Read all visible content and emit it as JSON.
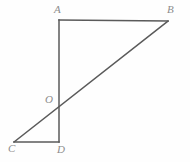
{
  "figure": {
    "name": "quadrilateral-with-diagonal",
    "background_color": "#fefefe",
    "stroke_color": "#5a5a5a",
    "label_color": "#8d8d8d",
    "stroke_width": 1.5,
    "width": 190,
    "height": 162,
    "points": {
      "A": {
        "label": "A",
        "x": 59,
        "y": 20
      },
      "B": {
        "label": "B",
        "x": 168,
        "y": 21
      },
      "C": {
        "label": "C",
        "x": 14,
        "y": 142
      },
      "D": {
        "label": "D",
        "x": 59,
        "y": 142
      },
      "O": {
        "label": "O",
        "x": 59,
        "y": 102
      }
    },
    "segments": [
      {
        "name": "segment-ab",
        "from": "A",
        "to": "B"
      },
      {
        "name": "segment-ad",
        "from": "A",
        "to": "D"
      },
      {
        "name": "segment-cd",
        "from": "C",
        "to": "D"
      },
      {
        "name": "segment-cb",
        "from": "C",
        "to": "B"
      }
    ]
  }
}
